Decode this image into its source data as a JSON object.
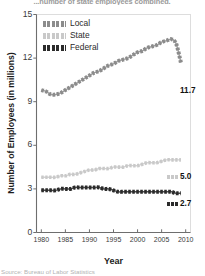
{
  "chart_data": {
    "type": "line",
    "title": "...number of state employees combined.",
    "xlabel": "Year",
    "ylabel": "Number of Employees (in millions)",
    "source": "Source: Bureau of Labor Statistics",
    "xlim": [
      1979,
      2011
    ],
    "ylim": [
      0,
      15
    ],
    "xticks": [
      1980,
      1985,
      1990,
      1995,
      2000,
      2005,
      2010
    ],
    "yticks": [
      0,
      3,
      6,
      9,
      12,
      15
    ],
    "grid": false,
    "legend_position": "top-left",
    "legend": [
      "Local",
      "State",
      "Federal"
    ],
    "colors": {
      "local": "#8c8c8c",
      "state": "#c9c9c9",
      "federal": "#2b2b2b",
      "axis": "#6e6e6e",
      "text": "#1c1c1c"
    },
    "x": [
      1980,
      1981,
      1982,
      1983,
      1984,
      1985,
      1986,
      1987,
      1988,
      1989,
      1990,
      1991,
      1992,
      1993,
      1994,
      1995,
      1996,
      1997,
      1998,
      1999,
      2000,
      2001,
      2002,
      2003,
      2004,
      2005,
      2006,
      2007,
      2008,
      2009
    ],
    "series": [
      {
        "name": "Local",
        "end_label": "11.7",
        "values": [
          9.8,
          9.7,
          9.5,
          9.5,
          9.6,
          9.8,
          10.0,
          10.2,
          10.4,
          10.6,
          10.8,
          11.0,
          11.1,
          11.3,
          11.5,
          11.6,
          11.8,
          11.9,
          12.0,
          12.2,
          12.4,
          12.5,
          12.7,
          12.8,
          12.9,
          13.1,
          13.2,
          13.3,
          13.0,
          11.7
        ]
      },
      {
        "name": "State",
        "end_label": "5.0",
        "values": [
          3.8,
          3.8,
          3.8,
          3.8,
          3.9,
          3.9,
          4.0,
          4.0,
          4.1,
          4.2,
          4.3,
          4.3,
          4.4,
          4.4,
          4.4,
          4.5,
          4.5,
          4.5,
          4.6,
          4.6,
          4.6,
          4.7,
          4.8,
          4.8,
          4.8,
          4.9,
          5.0,
          5.0,
          5.0,
          5.0
        ]
      },
      {
        "name": "Federal",
        "end_label": "2.7",
        "values": [
          2.9,
          2.9,
          2.9,
          2.9,
          3.0,
          3.0,
          3.0,
          3.1,
          3.1,
          3.1,
          3.1,
          3.1,
          3.1,
          3.0,
          3.0,
          2.9,
          2.8,
          2.8,
          2.8,
          2.8,
          2.8,
          2.8,
          2.8,
          2.8,
          2.8,
          2.8,
          2.8,
          2.8,
          2.7,
          2.7
        ]
      }
    ]
  }
}
